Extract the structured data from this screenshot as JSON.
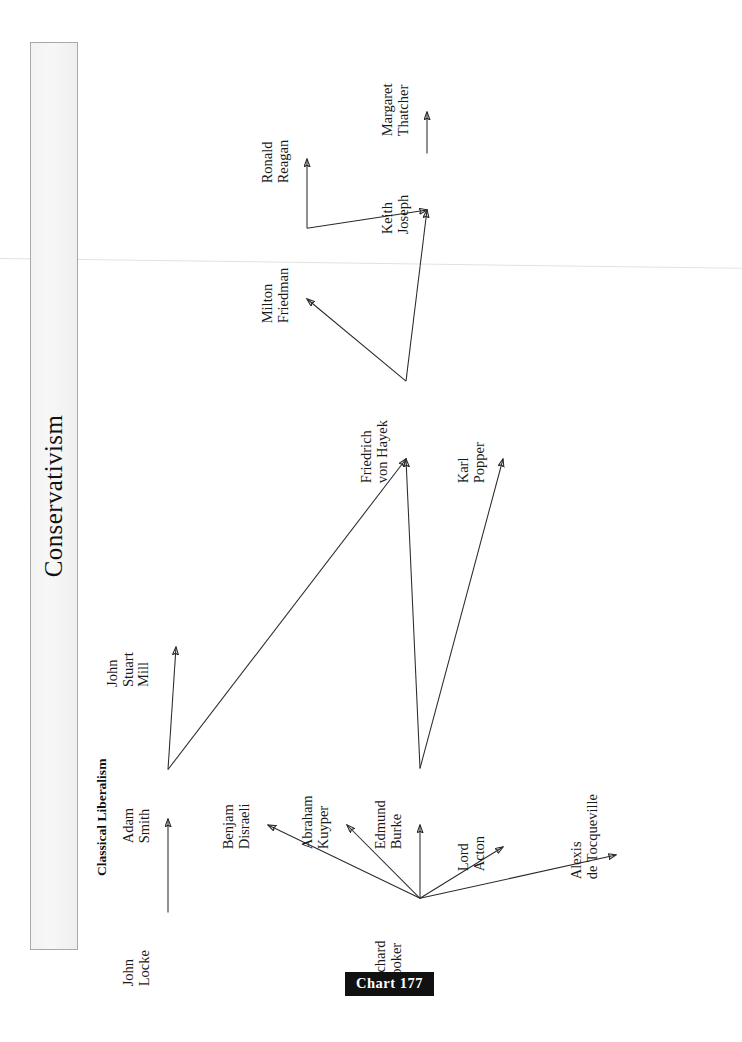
{
  "page": {
    "title": "Conservativism",
    "section_label": "Classical Liberalism",
    "chart_badge": "Chart 177",
    "background_color": "#ffffff",
    "title_bar_fill": "#f3f3f3",
    "title_bar_border": "#a8a8a8",
    "badge_background": "#111111",
    "badge_text_color": "#ffffff",
    "edge_color": "#2a2a2a"
  },
  "chart_data": {
    "type": "diagram",
    "subtype": "directed-influence-graph",
    "title": "Conservativism",
    "annotations": [
      "Classical Liberalism",
      "Chart 177"
    ],
    "orientation": "labels rotated 90 degrees counter-clockwise (landscape page)",
    "nodes": [
      {
        "id": "john-locke",
        "label_lines": [
          "John",
          "Locke"
        ],
        "x": 152,
        "y": 955
      },
      {
        "id": "adam-smith",
        "label_lines": [
          "Adam",
          "Smith"
        ],
        "x": 152,
        "y": 812
      },
      {
        "id": "john-stuart-mill",
        "label_lines": [
          "John",
          "Stuart",
          "Mill"
        ],
        "x": 152,
        "y": 640
      },
      {
        "id": "benjamin-disraeli",
        "label_lines": [
          "Benjam",
          "Disraeli"
        ],
        "x": 252,
        "y": 818
      },
      {
        "id": "abraham-kuyper",
        "label_lines": [
          "Abraham",
          "Kuyper"
        ],
        "x": 331,
        "y": 818
      },
      {
        "id": "edmund-burke",
        "label_lines": [
          "Edmund",
          "Burke"
        ],
        "x": 404,
        "y": 818
      },
      {
        "id": "lord-acton",
        "label_lines": [
          "Lord",
          "Acton"
        ],
        "x": 487,
        "y": 840
      },
      {
        "id": "alexis-de-tocqueville",
        "label_lines": [
          "Alexis",
          "de Tocqueville"
        ],
        "x": 600,
        "y": 848
      },
      {
        "id": "richard-hooker",
        "label_lines": [
          "Richard",
          "Hooker"
        ],
        "x": 404,
        "y": 955
      },
      {
        "id": "friedrich-von-hayek",
        "label_lines": [
          "Friedrich",
          "von Hayek"
        ],
        "x": 390,
        "y": 452
      },
      {
        "id": "karl-popper",
        "label_lines": [
          "Karl",
          "Popper"
        ],
        "x": 487,
        "y": 452
      },
      {
        "id": "milton-friedman",
        "label_lines": [
          "Milton",
          "Friedman"
        ],
        "x": 291,
        "y": 292
      },
      {
        "id": "ronald-reagan",
        "label_lines": [
          "Ronald",
          "Reagan"
        ],
        "x": 291,
        "y": 152
      },
      {
        "id": "keith-joseph",
        "label_lines": [
          "Keith",
          "Joseph"
        ],
        "x": 411,
        "y": 203
      },
      {
        "id": "margaret-thatcher",
        "label_lines": [
          "Margaret",
          "Thatcher"
        ],
        "x": 411,
        "y": 105
      }
    ],
    "edges": [
      {
        "from": "john-locke",
        "to": "adam-smith"
      },
      {
        "from": "adam-smith",
        "to": "john-stuart-mill"
      },
      {
        "from": "adam-smith",
        "to": "friedrich-von-hayek"
      },
      {
        "from": "richard-hooker",
        "to": "benjamin-disraeli"
      },
      {
        "from": "richard-hooker",
        "to": "abraham-kuyper"
      },
      {
        "from": "richard-hooker",
        "to": "edmund-burke"
      },
      {
        "from": "richard-hooker",
        "to": "lord-acton"
      },
      {
        "from": "richard-hooker",
        "to": "alexis-de-tocqueville"
      },
      {
        "from": "edmund-burke",
        "to": "friedrich-von-hayek"
      },
      {
        "from": "edmund-burke",
        "to": "karl-popper"
      },
      {
        "from": "friedrich-von-hayek",
        "to": "milton-friedman"
      },
      {
        "from": "friedrich-von-hayek",
        "to": "keith-joseph"
      },
      {
        "from": "milton-friedman",
        "to": "ronald-reagan"
      },
      {
        "from": "milton-friedman",
        "to": "keith-joseph"
      },
      {
        "from": "keith-joseph",
        "to": "margaret-thatcher"
      }
    ]
  }
}
